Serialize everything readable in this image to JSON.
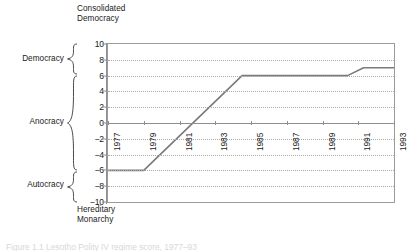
{
  "figure": {
    "top_annotation": "Consolidated\nDemocracy",
    "bottom_annotation": "Hereditary\nMonarchy",
    "caption": "Figure 1.1  Lesotho Polity IV regime score, 1977–93",
    "line_color": "#7a7a7a",
    "grid_color": "#a8a8a8",
    "axis_color": "#8f8f8f",
    "text_color": "#1a1a1a"
  },
  "regime_bands": [
    {
      "label": "Democracy",
      "from": 6,
      "to": 10
    },
    {
      "label": "Anocracy",
      "from": -6,
      "to": 6
    },
    {
      "label": "Autocracy",
      "from": -10,
      "to": -6
    }
  ],
  "chart_data": {
    "type": "line",
    "title": "",
    "subtitle": "",
    "xlabel": "",
    "ylabel": "",
    "xlim": [
      1977,
      1993
    ],
    "ylim": [
      -10,
      10
    ],
    "ytick_labels": [
      "10",
      "8",
      "6",
      "4",
      "2",
      "0",
      "-2",
      "-4",
      "-6",
      "-8",
      "-10"
    ],
    "ytick_values": [
      10,
      8,
      6,
      4,
      2,
      0,
      -2,
      -4,
      -6,
      -8,
      -10
    ],
    "xtick_labels": [
      "1977",
      "1979",
      "1981",
      "1983",
      "1985",
      "1987",
      "1989",
      "1991",
      "1993"
    ],
    "xtick_values": [
      1977,
      1979,
      1981,
      1983,
      1985,
      1987,
      1989,
      1991,
      1993
    ],
    "grid": true,
    "grid_style": "dotted-horizontal",
    "zero_line": true,
    "legend": false,
    "series": [
      {
        "name": "Polity score",
        "x": [
          1977,
          1979,
          1984.5,
          1990.4,
          1991.3,
          1993
        ],
        "values": [
          -6,
          -6,
          6,
          6,
          7,
          7
        ]
      }
    ],
    "annotations": [
      {
        "text": "Consolidated Democracy",
        "position": "above-axis-top"
      },
      {
        "text": "Hereditary Monarchy",
        "position": "below-axis-bottom"
      }
    ]
  }
}
